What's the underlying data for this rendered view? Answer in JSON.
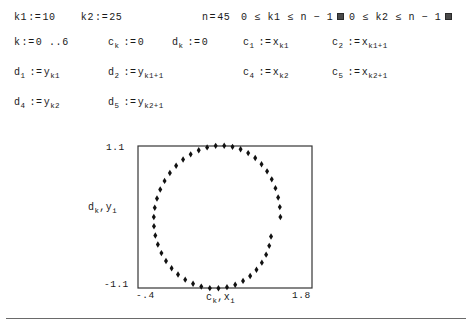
{
  "document": {
    "type": "mathcad-worksheet"
  },
  "definitions": {
    "line1": [
      {
        "name": "k1",
        "op": ":=",
        "value": "10"
      },
      {
        "name": "k2",
        "op": ":=",
        "value": "25"
      },
      {
        "name": "n",
        "op": "=",
        "value": "45"
      },
      {
        "constraint": "0 ≤ k1 ≤ n − 1",
        "indicator": "box"
      },
      {
        "constraint": "0 ≤ k2 ≤ n − 1",
        "indicator": "box"
      }
    ],
    "line2": [
      {
        "name": "k",
        "op": ":=",
        "value": "0 ..6"
      },
      {
        "name": "c",
        "sub": "k",
        "op": ":=",
        "value": "0"
      },
      {
        "name": "d",
        "sub": "k",
        "op": ":=",
        "value": "0"
      },
      {
        "name": "c",
        "sub": "1",
        "op": ":=",
        "value": "x",
        "value_sub": "k1"
      },
      {
        "name": "c",
        "sub": "2",
        "op": ":=",
        "value": "x",
        "value_sub": "k1+1"
      }
    ],
    "line3": [
      {
        "name": "d",
        "sub": "1",
        "op": ":=",
        "value": "y",
        "value_sub": "k1"
      },
      {
        "name": "d",
        "sub": "2",
        "op": ":=",
        "value": "y",
        "value_sub": "k1+1"
      },
      {
        "name": "c",
        "sub": "4",
        "op": ":=",
        "value": "x",
        "value_sub": "k2"
      },
      {
        "name": "c",
        "sub": "5",
        "op": ":=",
        "value": "x",
        "value_sub": "k2+1"
      }
    ],
    "line4": [
      {
        "name": "d",
        "sub": "4",
        "op": ":=",
        "value": "y",
        "value_sub": "k2"
      },
      {
        "name": "d",
        "sub": "5",
        "op": ":=",
        "value": "y",
        "value_sub": "k2+1"
      }
    ]
  },
  "labels": {
    "k1_name": "k1",
    "k1_op": ":=",
    "k1_val": "10",
    "k2_name": "k2",
    "k2_op": ":=",
    "k2_val": "25",
    "n_name": "n",
    "n_op": "=",
    "n_val": "45",
    "con1": "0 ≤ k1 ≤ n − 1",
    "con2": "0 ≤ k2 ≤ n − 1",
    "k_name": "k",
    "k_op": ":=",
    "k_val": "0 ..6",
    "ck_name": "c",
    "ck_sub": "k",
    "ck_op": ":=",
    "ck_val": "0",
    "dk_name": "d",
    "dk_sub": "k",
    "dk_op": ":=",
    "dk_val": "0",
    "c1_name": "c",
    "c1_sub": "1",
    "c1_op": ":=",
    "c1_val": "x",
    "c1_vsub": "k1",
    "c2_name": "c",
    "c2_sub": "2",
    "c2_op": ":=",
    "c2_val": "x",
    "c2_vsub": "k1+1",
    "d1_name": "d",
    "d1_sub": "1",
    "d1_op": ":=",
    "d1_val": "y",
    "d1_vsub": "k1",
    "d2_name": "d",
    "d2_sub": "2",
    "d2_op": ":=",
    "d2_val": "y",
    "d2_vsub": "k1+1",
    "c4_name": "c",
    "c4_sub": "4",
    "c4_op": ":=",
    "c4_val": "x",
    "c4_vsub": "k2",
    "c5_name": "c",
    "c5_sub": "5",
    "c5_op": ":=",
    "c5_val": "x",
    "c5_vsub": "k2+1",
    "d4_name": "d",
    "d4_sub": "4",
    "d4_op": ":=",
    "d4_val": "y",
    "d4_vsub": "k2",
    "d5_name": "d",
    "d5_sub": "5",
    "d5_op": ":=",
    "d5_val": "y",
    "d5_vsub": "k2+1"
  },
  "chart_data": {
    "type": "scatter",
    "title": "",
    "xlabel_main": "c",
    "xlabel_main_sub": "k",
    "xlabel_sep": ",",
    "xlabel_second": "x",
    "xlabel_second_sub": "i",
    "ylabel_main": "d",
    "ylabel_main_sub": "k",
    "ylabel_sep": ",",
    "ylabel_second": "y",
    "ylabel_second_sub": "i",
    "xlim": [
      -0.4,
      1.8
    ],
    "ylim": [
      -1.1,
      1.1
    ],
    "xtick_min": "-.4",
    "xtick_max": "1.8",
    "ytick_min": "-1.1",
    "ytick_max": "1.1",
    "grid": false,
    "legend": false,
    "series": [
      {
        "name": "x_i , y_i",
        "marker": "diamond",
        "style": "points",
        "n": 45,
        "x": [
          1.4,
          1.393,
          1.372,
          1.338,
          1.291,
          1.232,
          1.162,
          1.082,
          0.993,
          0.897,
          0.795,
          0.69,
          0.582,
          0.474,
          0.368,
          0.266,
          0.17,
          0.082,
          0.003,
          -0.064,
          -0.119,
          -0.16,
          -0.188,
          -0.2,
          -0.198,
          -0.181,
          -0.149,
          -0.104,
          -0.046,
          0.025,
          0.106,
          0.197,
          0.296,
          0.4,
          0.508,
          0.617,
          0.725,
          0.829,
          0.928,
          1.018,
          1.098,
          1.166,
          1.22,
          1.259,
          1.282
        ],
        "y": [
          0.0,
          0.153,
          0.303,
          0.447,
          0.583,
          0.707,
          0.818,
          0.913,
          0.99,
          1.049,
          1.087,
          1.105,
          1.102,
          1.078,
          1.034,
          0.971,
          0.89,
          0.793,
          0.682,
          0.559,
          0.426,
          0.287,
          0.144,
          0.0,
          -0.144,
          -0.287,
          -0.426,
          -0.559,
          -0.682,
          -0.793,
          -0.89,
          -0.971,
          -1.034,
          -1.078,
          -1.102,
          -1.105,
          -1.087,
          -1.049,
          -0.99,
          -0.913,
          -0.818,
          -0.707,
          -0.583,
          -0.447,
          -0.303
        ]
      },
      {
        "name": "c_k , d_k",
        "marker": "none",
        "style": "line",
        "n": 7,
        "x": [
          0.0,
          0.0,
          0.0,
          0.0,
          0.0,
          0.0,
          0.0
        ],
        "y": [
          0.0,
          0.0,
          0.0,
          0.0,
          0.0,
          0.0,
          0.0
        ],
        "polyline_px": [
          [
            178,
            203
          ],
          [
            160,
            236
          ],
          [
            183,
            257
          ],
          [
            178,
            203
          ],
          [
            286,
            182
          ],
          [
            160,
            236
          ],
          [
            178,
            203
          ],
          [
            288,
            185
          ]
        ],
        "note": "connected path through c_k , d_k values"
      }
    ]
  }
}
